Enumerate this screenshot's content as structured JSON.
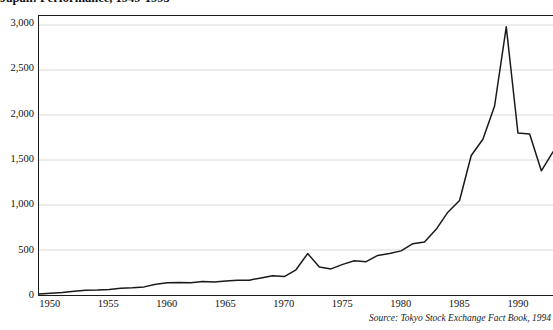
{
  "chart_data": {
    "type": "line",
    "title": "Japan: Performance, 1949-1993",
    "xlabel": "",
    "ylabel": "",
    "xlim": [
      1949,
      1993
    ],
    "ylim": [
      0,
      3100
    ],
    "grid": true,
    "legend": false,
    "legend_position": "none",
    "source": "Source: Tokyo Stock Exchange Fact Book, 1994",
    "ytick_labels": [
      "0",
      "500",
      "1,000",
      "1,500",
      "2,000",
      "2,500",
      "3,000"
    ],
    "ytick_values": [
      0,
      500,
      1000,
      1500,
      2000,
      2500,
      3000
    ],
    "xtick_labels": [
      "1950",
      "1955",
      "1960",
      "1965",
      "1970",
      "1975",
      "1980",
      "1985",
      "1990"
    ],
    "xtick_values": [
      1950,
      1955,
      1960,
      1965,
      1970,
      1975,
      1980,
      1985,
      1990
    ],
    "series": [
      {
        "name": "Tokyo Stock Exchange Index",
        "x": [
          1949,
          1950,
          1951,
          1952,
          1953,
          1954,
          1955,
          1956,
          1957,
          1958,
          1959,
          1960,
          1961,
          1962,
          1963,
          1964,
          1965,
          1966,
          1967,
          1968,
          1969,
          1970,
          1971,
          1972,
          1973,
          1974,
          1975,
          1976,
          1977,
          1978,
          1979,
          1980,
          1981,
          1982,
          1983,
          1984,
          1985,
          1986,
          1987,
          1988,
          1989,
          1990,
          1991,
          1992,
          1993
        ],
        "values": [
          12,
          20,
          28,
          42,
          52,
          55,
          62,
          75,
          80,
          90,
          120,
          135,
          140,
          135,
          150,
          145,
          155,
          165,
          165,
          190,
          215,
          205,
          280,
          460,
          310,
          290,
          340,
          380,
          370,
          440,
          460,
          490,
          570,
          590,
          730,
          920,
          1050,
          1550,
          1730,
          2100,
          2980,
          1800,
          1790,
          1380,
          1590
        ]
      }
    ],
    "annotations": []
  },
  "axis": {
    "y_labels": [
      "3,000",
      "2,500",
      "2,000",
      "1,500",
      "1,000",
      "500",
      "0"
    ],
    "x_labels": [
      "1950",
      "1955",
      "1960",
      "1965",
      "1970",
      "1975",
      "1980",
      "1985",
      "1990"
    ]
  },
  "footer": {
    "source": "Source: Tokyo Stock Exchange Fact Book, 1994"
  },
  "style": {
    "line_color": "#1a1a1a",
    "grid_color": "#d8d8d8",
    "axis_color": "#1a1a1a",
    "background": "#ffffff"
  }
}
